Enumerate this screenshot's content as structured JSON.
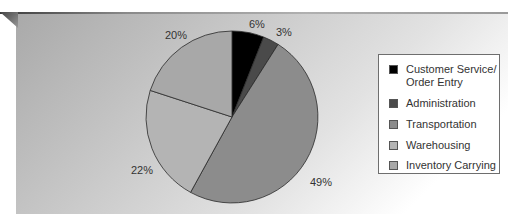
{
  "chart_data": {
    "type": "pie",
    "title": "",
    "start_angle": "12 o'clock",
    "direction": "clockwise",
    "categories": [
      "Customer Service/ Order Entry",
      "Administration",
      "Transportation",
      "Warehousing",
      "Inventory Carrying"
    ],
    "values": [
      6,
      3,
      49,
      22,
      20
    ],
    "unit": "%",
    "colors": [
      "#000000",
      "#4a4a4a",
      "#8c8c8c",
      "#b4b4b4",
      "#a8a8a8"
    ],
    "labels": [
      "6%",
      "3%",
      "49%",
      "22%",
      "20%"
    ],
    "legend_position": "right"
  },
  "labels": {
    "customer_service": "6%",
    "administration": "3%",
    "transportation": "49%",
    "warehousing": "22%",
    "inventory_carrying": "20%"
  },
  "legend": {
    "items": [
      {
        "line1": "Customer Service/",
        "line2": "Order Entry",
        "color": "#000000"
      },
      {
        "line1": "Administration",
        "color": "#4a4a4a"
      },
      {
        "line1": "Transportation",
        "color": "#8c8c8c"
      },
      {
        "line1": "Warehousing",
        "color": "#b4b4b4"
      },
      {
        "line1": "Inventory Carrying",
        "color": "#a8a8a8"
      }
    ]
  }
}
